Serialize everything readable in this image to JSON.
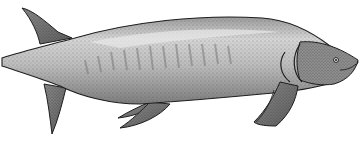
{
  "image": {
    "subject": "stippled illustration of a prehistoric lobe-finned fish",
    "background": "#ffffff",
    "colors": {
      "body_light": "#c8c8c8",
      "body_mid": "#a6a6a6",
      "body_dark": "#6e6e6e",
      "outline": "#1e1e1e",
      "highlight": "#e2e2e2"
    }
  }
}
